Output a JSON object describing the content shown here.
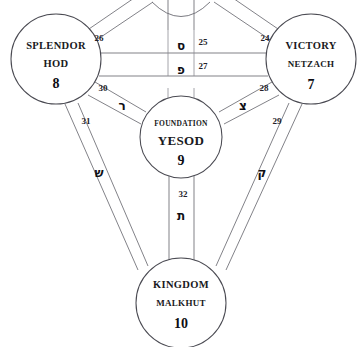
{
  "diagram": {
    "background_color": "#ffffff",
    "line_color": "#6b6b73",
    "text_color": "#191921"
  },
  "sephirot": [
    {
      "id": "hod",
      "name_english": "SPLENDOR",
      "name_hebrew_translit": "HOD",
      "number": "8",
      "cx": 56,
      "cy": 59,
      "r": 45
    },
    {
      "id": "netzach",
      "name_english": "VICTORY",
      "name_hebrew_translit": "NETZACH",
      "number": "7",
      "cx": 311,
      "cy": 59,
      "r": 45
    },
    {
      "id": "yesod",
      "name_english": "FOUNDATION",
      "name_hebrew_translit": "YESOD",
      "number": "9",
      "cx": 181,
      "cy": 137,
      "r": 41
    },
    {
      "id": "malkhut",
      "name_english": "KINGDOM",
      "name_hebrew_translit": "MALKHUT",
      "number": "10",
      "cx": 181,
      "cy": 303,
      "r": 45
    }
  ],
  "paths": [
    {
      "number": "26",
      "hebrew": "",
      "label_x": 99,
      "label_y": 38
    },
    {
      "number": "25",
      "hebrew": "ס",
      "label_x": 203,
      "label_y": 42,
      "heb_x": 175,
      "heb_y": 46
    },
    {
      "number": "24",
      "hebrew": "",
      "label_x": 265,
      "label_y": 38
    },
    {
      "number": "27",
      "hebrew": "פ",
      "label_x": 203,
      "label_y": 66,
      "heb_x": 175,
      "heb_y": 70
    },
    {
      "number": "30",
      "hebrew": "ר",
      "label_x": 103,
      "label_y": 88,
      "heb_x": 122,
      "heb_y": 105
    },
    {
      "number": "28",
      "hebrew": "צ",
      "label_x": 264,
      "label_y": 88,
      "heb_x": 243,
      "heb_y": 105
    },
    {
      "number": "31",
      "hebrew": "ש",
      "label_x": 86,
      "label_y": 121,
      "heb_x": 99,
      "heb_y": 172
    },
    {
      "number": "29",
      "hebrew": "ק",
      "label_x": 277,
      "label_y": 121,
      "heb_x": 262,
      "heb_y": 172
    },
    {
      "number": "32",
      "hebrew": "ת",
      "label_x": 183,
      "label_y": 194,
      "heb_x": 183,
      "heb_y": 215
    }
  ]
}
